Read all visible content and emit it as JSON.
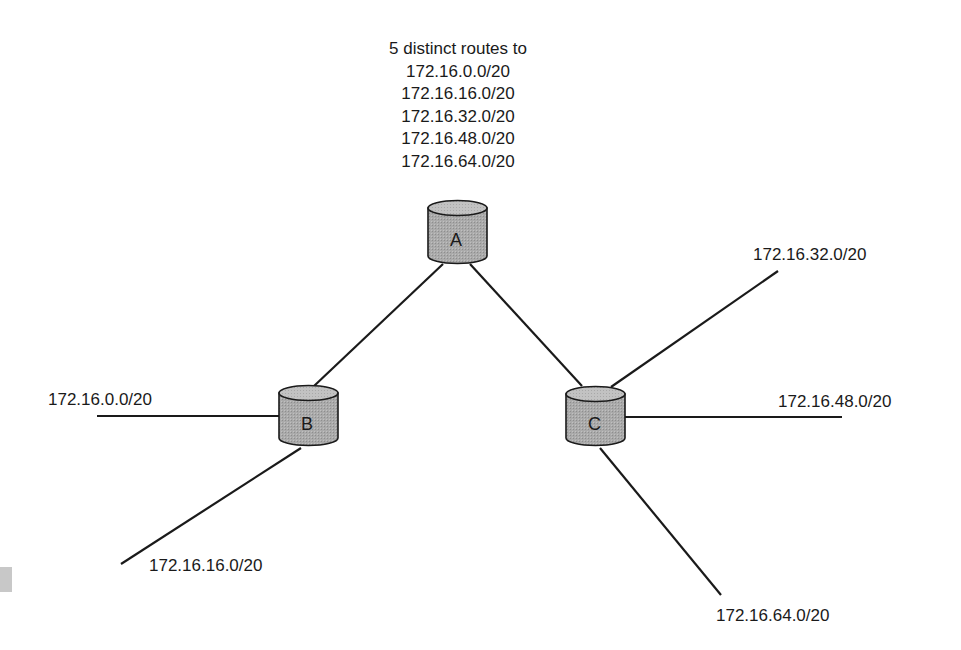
{
  "header": {
    "title": "5 distinct routes to",
    "routes": [
      "172.16.0.0/20",
      "172.16.16.0/20",
      "172.16.32.0/20",
      "172.16.48.0/20",
      "172.16.64.0/20"
    ]
  },
  "routers": {
    "a": {
      "label": "A"
    },
    "b": {
      "label": "B"
    },
    "c": {
      "label": "C"
    }
  },
  "networks": {
    "b_left": "172.16.0.0/20",
    "b_bottom": "172.16.16.0/20",
    "c_upper": "172.16.32.0/20",
    "c_right": "172.16.48.0/20",
    "c_lower": "172.16.64.0/20"
  },
  "colors": {
    "router_fill": "#a9a9a9",
    "router_top": "#c4c4c4",
    "line": "#1a1a1a"
  }
}
